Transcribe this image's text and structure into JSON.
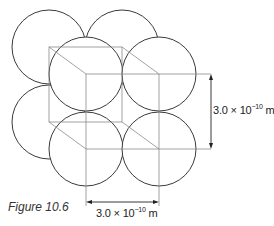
{
  "figure": {
    "caption": "Figure 10.6",
    "dimension_vertical": {
      "mantissa": "3.0 × 10",
      "exponent": "−10",
      "unit": " m"
    },
    "dimension_horizontal": {
      "mantissa": "3.0 × 10",
      "exponent": "−10",
      "unit": " m"
    },
    "colors": {
      "circle_stroke": "#3a3a3a",
      "cube_line": "#8a8a8a",
      "arrow": "#222222",
      "background": "#ffffff"
    },
    "geometry": {
      "radius": 37,
      "back_circles": [
        [
          49,
          47
        ],
        [
          122,
          47
        ],
        [
          49,
          122
        ]
      ],
      "front_circles": [
        [
          86,
          74
        ],
        [
          159,
          74
        ],
        [
          86,
          149
        ],
        [
          159,
          149
        ]
      ],
      "back_square": [
        49,
        47,
        122,
        122
      ],
      "front_square": [
        86,
        74,
        159,
        149
      ]
    }
  }
}
